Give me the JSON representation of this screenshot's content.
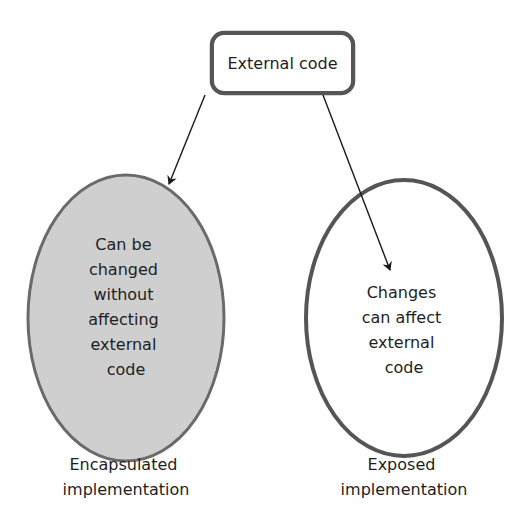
{
  "diagram": {
    "top_box": {
      "label": "External code"
    },
    "left_node": {
      "lines": [
        "Can be",
        "changed",
        "without",
        "affecting",
        "external",
        "code"
      ],
      "caption": [
        "Encapsulated",
        "implementation"
      ],
      "fill": "#cdcdcd"
    },
    "right_node": {
      "lines": [
        "Changes",
        "can affect",
        "external",
        "code"
      ],
      "caption": [
        "Exposed",
        "implementation"
      ],
      "fill": "#ffffff"
    },
    "arrows": [
      {
        "from": "top_box",
        "to": "left_node"
      },
      {
        "from": "top_box",
        "to": "right_node"
      }
    ]
  }
}
